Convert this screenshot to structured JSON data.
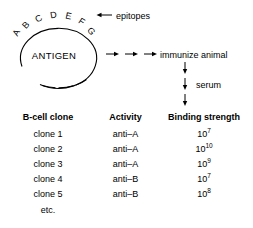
{
  "schematic": {
    "antigen_label": "ANTIGEN",
    "epitope_letters": [
      "A",
      "B",
      "C",
      "D",
      "E",
      "F",
      "G"
    ],
    "epitopes_label": "epitopes",
    "immunize_label": "immunize animal",
    "serum_label": "serum"
  },
  "table": {
    "headers": {
      "clone": "B-cell clone",
      "activity": "Activity",
      "binding": "Binding strength"
    },
    "rows": [
      {
        "clone": "clone 1",
        "activity": "anti–A",
        "binding_base": "10",
        "binding_exp": "7"
      },
      {
        "clone": "clone 2",
        "activity": "anti–A",
        "binding_base": "10",
        "binding_exp": "10"
      },
      {
        "clone": "clone 3",
        "activity": "anti–A",
        "binding_base": "10",
        "binding_exp": "9"
      },
      {
        "clone": "clone 4",
        "activity": "anti–B",
        "binding_base": "10",
        "binding_exp": "7"
      },
      {
        "clone": "clone 5",
        "activity": "anti–B",
        "binding_base": "10",
        "binding_exp": "8"
      }
    ],
    "etc_label": "etc."
  },
  "colors": {
    "ink": "#000000",
    "background": "#ffffff"
  }
}
